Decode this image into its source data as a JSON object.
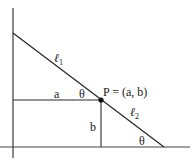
{
  "diagram": {
    "point_label": "P = (a, b)",
    "line_upper_label": "ℓ",
    "line_upper_subscript": "1",
    "line_lower_label": "ℓ",
    "line_lower_subscript": "2",
    "horizontal_segment_label": "a",
    "vertical_segment_label": "b",
    "angle_at_p_label": "θ",
    "angle_at_x_axis_label": "θ",
    "colors": {
      "stroke": "#2a2a2a",
      "axis": "#555555",
      "point": "#111111"
    }
  }
}
